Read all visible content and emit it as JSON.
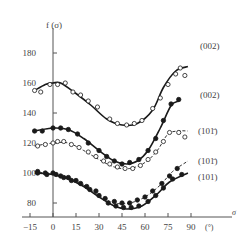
{
  "chart_data": {
    "type": "line",
    "title": "",
    "xlabel": "σ",
    "xunit": "(°)",
    "ylabel": "f (σ)",
    "xlim": [
      -15,
      95
    ],
    "ylim": [
      75,
      190
    ],
    "x_ticks": [
      -15,
      0,
      15,
      30,
      45,
      60,
      75,
      90
    ],
    "y_ticks": [
      80,
      100,
      120,
      140,
      160,
      180
    ],
    "grid": false,
    "legend_position": "right, inline labels",
    "series": [
      {
        "name": "(002) open",
        "label": "(002)",
        "marker": "open-circle",
        "line": "solid",
        "curve": [
          [
            -12,
            155
          ],
          [
            -5,
            159
          ],
          [
            0,
            160
          ],
          [
            5,
            160
          ],
          [
            15,
            153
          ],
          [
            25,
            145
          ],
          [
            35,
            136
          ],
          [
            45,
            132
          ],
          [
            55,
            133
          ],
          [
            65,
            142
          ],
          [
            72,
            157
          ],
          [
            80,
            168
          ],
          [
            88,
            171
          ]
        ],
        "points": [
          [
            -12,
            155
          ],
          [
            -8,
            154
          ],
          [
            -2,
            159
          ],
          [
            3,
            159
          ],
          [
            8,
            160
          ],
          [
            13,
            154
          ],
          [
            18,
            152
          ],
          [
            23,
            148
          ],
          [
            29,
            144
          ],
          [
            37,
            136
          ],
          [
            42,
            133
          ],
          [
            48,
            132
          ],
          [
            53,
            133
          ],
          [
            58,
            135
          ],
          [
            65,
            143
          ],
          [
            70,
            150
          ],
          [
            75,
            159
          ],
          [
            80,
            166
          ],
          [
            83,
            170
          ],
          [
            86,
            165
          ]
        ]
      },
      {
        "name": "(002) filled",
        "label": "(002)",
        "marker": "filled-circle",
        "line": "solid",
        "curve": [
          [
            -12,
            128
          ],
          [
            0,
            130
          ],
          [
            10,
            129
          ],
          [
            20,
            123
          ],
          [
            30,
            115
          ],
          [
            40,
            108
          ],
          [
            48,
            106
          ],
          [
            55,
            108
          ],
          [
            62,
            115
          ],
          [
            70,
            130
          ],
          [
            77,
            145
          ],
          [
            82,
            148
          ]
        ],
        "points": [
          [
            -12,
            128
          ],
          [
            -7,
            128
          ],
          [
            0,
            130
          ],
          [
            5,
            130
          ],
          [
            10,
            129
          ],
          [
            16,
            126
          ],
          [
            23,
            120
          ],
          [
            30,
            115
          ],
          [
            35,
            111
          ],
          [
            40,
            108
          ],
          [
            45,
            106
          ],
          [
            50,
            107
          ],
          [
            56,
            109
          ],
          [
            62,
            115
          ],
          [
            67,
            123
          ],
          [
            72,
            135
          ],
          [
            77,
            146
          ],
          [
            82,
            149
          ]
        ]
      },
      {
        "name": "(10-1) open",
        "label": "(10 1̄)",
        "marker": "open-circle",
        "line": "dashed",
        "curve": [
          [
            -12,
            118
          ],
          [
            0,
            120
          ],
          [
            10,
            120
          ],
          [
            20,
            115
          ],
          [
            30,
            109
          ],
          [
            40,
            104
          ],
          [
            50,
            103
          ],
          [
            60,
            107
          ],
          [
            68,
            115
          ],
          [
            75,
            126
          ],
          [
            82,
            128
          ],
          [
            88,
            128
          ]
        ],
        "points": [
          [
            -10,
            118
          ],
          [
            -5,
            119
          ],
          [
            0,
            120
          ],
          [
            3,
            121
          ],
          [
            7,
            121
          ],
          [
            12,
            119
          ],
          [
            17,
            117
          ],
          [
            23,
            114
          ],
          [
            28,
            111
          ],
          [
            33,
            108
          ],
          [
            37,
            106
          ],
          [
            42,
            104
          ],
          [
            47,
            103
          ],
          [
            52,
            103
          ],
          [
            57,
            105
          ],
          [
            62,
            109
          ],
          [
            67,
            114
          ],
          [
            72,
            121
          ],
          [
            76,
            127
          ],
          [
            82,
            127
          ],
          [
            86,
            124
          ]
        ]
      },
      {
        "name": "(10-1) filled",
        "label": "(10 1̄)",
        "marker": "filled-circle",
        "line": "dashed",
        "curve": [
          [
            -12,
            101
          ],
          [
            0,
            99
          ],
          [
            10,
            97
          ],
          [
            20,
            92
          ],
          [
            30,
            85
          ],
          [
            40,
            80
          ],
          [
            50,
            80
          ],
          [
            60,
            84
          ],
          [
            70,
            92
          ],
          [
            78,
            101
          ],
          [
            88,
            108
          ]
        ],
        "points": [
          [
            -10,
            101
          ],
          [
            -5,
            100
          ],
          [
            0,
            100
          ],
          [
            5,
            98
          ],
          [
            10,
            97
          ],
          [
            15,
            95
          ],
          [
            22,
            91
          ],
          [
            28,
            88
          ],
          [
            34,
            83
          ],
          [
            40,
            81
          ],
          [
            45,
            80
          ],
          [
            50,
            80
          ],
          [
            55,
            82
          ],
          [
            60,
            84
          ],
          [
            65,
            88
          ],
          [
            71,
            93
          ],
          [
            76,
            98
          ],
          [
            81,
            103
          ]
        ]
      },
      {
        "name": "(101) filled",
        "label": "(101)",
        "marker": "filled-circle",
        "line": "solid",
        "curve": [
          [
            -12,
            100
          ],
          [
            0,
            99
          ],
          [
            10,
            96
          ],
          [
            20,
            91
          ],
          [
            30,
            84
          ],
          [
            40,
            78
          ],
          [
            48,
            76
          ],
          [
            58,
            78
          ],
          [
            68,
            86
          ],
          [
            76,
            94
          ],
          [
            88,
            100
          ]
        ],
        "points": [
          [
            -10,
            100
          ],
          [
            -4,
            99
          ],
          [
            2,
            99
          ],
          [
            7,
            97
          ],
          [
            12,
            95
          ],
          [
            18,
            93
          ],
          [
            24,
            89
          ],
          [
            30,
            85
          ],
          [
            36,
            80
          ],
          [
            41,
            78
          ],
          [
            46,
            77
          ],
          [
            51,
            77
          ],
          [
            56,
            78
          ],
          [
            62,
            81
          ],
          [
            67,
            85
          ],
          [
            72,
            90
          ],
          [
            78,
            96
          ],
          [
            84,
            99
          ]
        ]
      }
    ]
  },
  "axes": {
    "y_label": "f",
    "y_label_arg": "(σ)",
    "x_label": "σ",
    "x_unit": "(°)",
    "x_tick_labels": [
      "−15",
      "0",
      "15",
      "30",
      "45",
      "60",
      "75",
      "90"
    ],
    "y_tick_labels": [
      "80",
      "100",
      "120",
      "140",
      "160",
      "180"
    ]
  },
  "legend": {
    "labels": [
      "(002)",
      "(002)",
      "(101̄)",
      "(101̄)",
      "(101)"
    ]
  },
  "colors": {
    "ink": "#1a1a1a",
    "axis": "#555555",
    "text": "#444444",
    "background": "#ffffff"
  }
}
